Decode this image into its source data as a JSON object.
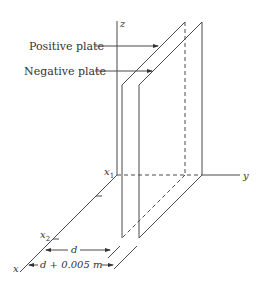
{
  "figure": {
    "labels": {
      "positive_plate": "Positive plate",
      "negative_plate": "Negative plate"
    },
    "axes": {
      "z": "z",
      "y": "y",
      "x": "x"
    },
    "points": {
      "x1": "x",
      "x1_sub": "1",
      "x2": "x",
      "x2_sub": "2"
    },
    "dimensions": {
      "d": "d",
      "d_plus": "d + 0.005 m"
    },
    "colors": {
      "line": "#4a4a4a",
      "text": "#333333",
      "background": "#ffffff"
    }
  }
}
